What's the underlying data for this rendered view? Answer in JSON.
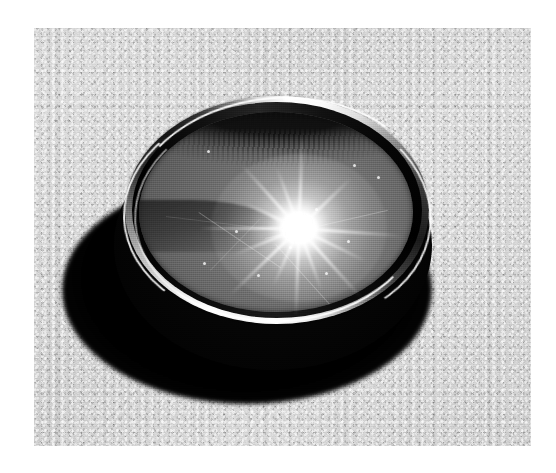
{
  "image": {
    "domain": "Natural-Image",
    "title": "Photograph of a plano-convex glass lens on a textured surface",
    "description": "Black-and-white photograph showing a circular optical glass lens (watch-glass style) resting on a granular light-grey surface, with a bright multi-ray sun starburst reflected off its polished surface and a deep black cast shadow beneath.",
    "color_mode": "grayscale",
    "print_border": "white",
    "canvas": {
      "width": 556,
      "height": 473
    },
    "photo_area": {
      "left": 34,
      "top": 28,
      "width": 497,
      "height": 418
    }
  },
  "scene": {
    "subject_name": "glass-lens",
    "subject_label": "Circular glass lens",
    "background_label": "Granular light-grey surface",
    "shadow_label": "Cast shadow",
    "starburst_label": "Sun starburst reflection",
    "rim_label": "Polished bevelled rim",
    "treeline_label": "Reflected treeline",
    "horizon_label": "Reflected horizon band"
  },
  "palette": {
    "paper_white": "#ffffff",
    "surface_light": "#d6d6d6",
    "surface_mid": "#c7c7c7",
    "surface_dark": "#b4b4b4",
    "glass_light": "#8e8e8e",
    "glass_mid": "#7a7a7a",
    "glass_dark": "#5a5a5a",
    "rim_highlight": "#ffffff",
    "rim_dark": "#141414",
    "shadow_black": "#000000",
    "starburst_white": "#ffffff"
  },
  "geometry": {
    "lens_center_x": 242,
    "lens_center_y": 184,
    "lens_width": 304,
    "lens_height": 228,
    "starburst_center_x": 265,
    "starburst_center_y": 200,
    "ray_count": 14
  },
  "starburst_rays": [
    {
      "angle": 4,
      "length": 104
    },
    {
      "angle": 26,
      "length": 74
    },
    {
      "angle": 48,
      "length": 92
    },
    {
      "angle": 70,
      "length": 66
    },
    {
      "angle": 92,
      "length": 88
    },
    {
      "angle": 114,
      "length": 62
    },
    {
      "angle": 136,
      "length": 96
    },
    {
      "angle": 158,
      "length": 70
    },
    {
      "angle": 180,
      "length": 100
    },
    {
      "angle": 205,
      "length": 60
    },
    {
      "angle": 228,
      "length": 86
    },
    {
      "angle": 250,
      "length": 64
    },
    {
      "angle": 272,
      "length": 90
    },
    {
      "angle": 316,
      "length": 72
    }
  ],
  "glass_specks": [
    {
      "x": 68,
      "y": 38
    },
    {
      "x": 214,
      "y": 52
    },
    {
      "x": 238,
      "y": 64
    },
    {
      "x": 96,
      "y": 118
    },
    {
      "x": 176,
      "y": 96
    },
    {
      "x": 150,
      "y": 134
    },
    {
      "x": 64,
      "y": 150
    },
    {
      "x": 208,
      "y": 128
    },
    {
      "x": 118,
      "y": 162
    },
    {
      "x": 186,
      "y": 160
    }
  ]
}
